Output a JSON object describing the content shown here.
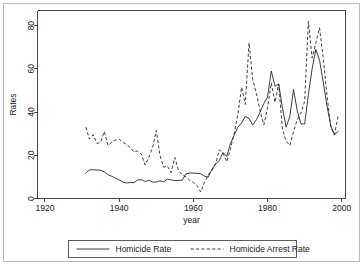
{
  "figure": {
    "background_color": "#ffffff",
    "frame_color": "#b9b9b9",
    "ink_color": "#1a1a1a"
  },
  "chart_data": {
    "type": "line",
    "title": "",
    "subtitle": "",
    "xlabel": "year",
    "ylabel": "Rates",
    "xlim": [
      1918,
      2001
    ],
    "ylim": [
      0,
      87
    ],
    "xticks": [
      1920,
      1940,
      1960,
      1980,
      2000
    ],
    "yticks": [
      0,
      20,
      40,
      60,
      80
    ],
    "xtick_labels": [
      "1920",
      "1940",
      "1960",
      "1980",
      "2000"
    ],
    "ytick_labels": [
      "0",
      "20",
      "40",
      "60",
      "80"
    ],
    "grid": false,
    "legend_position": "below-axis-center",
    "legend_entries": [
      "Homicide Rate",
      "Homicide Arrest Rate"
    ],
    "x": [
      1931,
      1932,
      1933,
      1934,
      1935,
      1936,
      1937,
      1938,
      1939,
      1940,
      1941,
      1942,
      1943,
      1944,
      1945,
      1946,
      1947,
      1948,
      1949,
      1950,
      1951,
      1952,
      1953,
      1954,
      1955,
      1956,
      1957,
      1958,
      1959,
      1960,
      1961,
      1962,
      1963,
      1964,
      1965,
      1966,
      1967,
      1968,
      1969,
      1970,
      1971,
      1972,
      1973,
      1974,
      1975,
      1976,
      1977,
      1978,
      1979,
      1980,
      1981,
      1982,
      1983,
      1984,
      1985,
      1986,
      1987,
      1988,
      1989,
      1990,
      1991,
      1992,
      1993,
      1994,
      1995,
      1996,
      1997,
      1998,
      1999
    ],
    "series": [
      {
        "name": "Homicide Rate",
        "style": "solid",
        "color": "#1a1a1a",
        "values": [
          11.8,
          13.2,
          13.3,
          13.2,
          13.1,
          12.3,
          11.0,
          10.3,
          9.4,
          8.6,
          7.6,
          7.2,
          7.4,
          7.3,
          8.6,
          8.7,
          7.9,
          8.5,
          7.6,
          7.6,
          8.2,
          7.7,
          9.0,
          8.6,
          8.3,
          8.4,
          8.4,
          11.4,
          11.8,
          11.8,
          11.6,
          11.5,
          10.3,
          9.9,
          13.5,
          16.0,
          17.6,
          21.3,
          19.5,
          25.5,
          29.3,
          33.0,
          35.0,
          38.0,
          37.0,
          34.0,
          36.5,
          40.0,
          44.0,
          47.0,
          59.0,
          52.0,
          53.0,
          42.0,
          33.0,
          38.0,
          50.5,
          40.5,
          34.5,
          34.5,
          48.0,
          60.0,
          69.0,
          64.0,
          54.0,
          43.0,
          34.0,
          29.5,
          31.0
        ]
      },
      {
        "name": "Homicide Arrest Rate",
        "style": "dashed",
        "color": "#1a1a1a",
        "values": [
          33.0,
          27.5,
          29.5,
          25.5,
          26.0,
          31.0,
          24.5,
          26.0,
          27.0,
          27.5,
          26.0,
          25.0,
          23.5,
          21.5,
          22.0,
          20.5,
          15.5,
          19.0,
          23.5,
          31.5,
          20.0,
          14.5,
          15.0,
          12.0,
          19.0,
          13.0,
          11.0,
          10.0,
          8.5,
          7.5,
          6.0,
          3.0,
          7.5,
          11.0,
          13.0,
          16.0,
          22.5,
          21.0,
          17.0,
          23.0,
          30.0,
          39.0,
          51.5,
          43.5,
          72.0,
          55.0,
          48.5,
          40.5,
          34.0,
          42.0,
          53.5,
          44.5,
          53.0,
          32.0,
          26.5,
          24.5,
          31.0,
          36.5,
          39.5,
          45.0,
          82.0,
          65.0,
          72.0,
          79.0,
          65.0,
          48.0,
          33.0,
          29.5,
          38.0
        ]
      }
    ]
  },
  "legend": {
    "items": [
      {
        "label": "Homicide Rate",
        "style": "solid"
      },
      {
        "label": "Homicide Arrest Rate",
        "style": "dashed"
      }
    ]
  }
}
